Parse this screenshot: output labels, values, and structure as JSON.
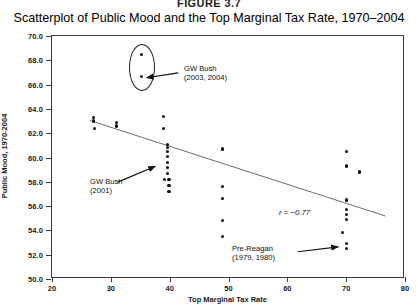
{
  "figure": {
    "number_label": "FIGURE 3.7",
    "title": "Scatterplot of Public Mood and the Top Marginal Tax Rate, 1970–2004"
  },
  "axes": {
    "x_title": "Top Marginal Tax Rate",
    "y_title": "Public Mood, 1970-2004",
    "x_ticks": [
      "20",
      "30",
      "40",
      "50",
      "60",
      "70",
      "80"
    ],
    "y_ticks": [
      "70.0",
      "68.0",
      "66.0",
      "64.0",
      "62.0",
      "60.0",
      "58.0",
      "56.0",
      "54.0",
      "52.0",
      "50.0"
    ]
  },
  "annotations": {
    "gw_bush_2003": "GW Bush\n(2003, 2004)",
    "gw_bush_2001": "GW Bush\n(2001)",
    "pre_reagan": "Pre-Reagan\n(1979, 1980)",
    "correlation": "r = −0.77"
  },
  "chart_data": {
    "type": "scatter",
    "title": "Scatterplot of Public Mood and the Top Marginal Tax Rate, 1970–2004",
    "xlabel": "Top Marginal Tax Rate",
    "ylabel": "Public Mood, 1970-2004",
    "xlim": [
      20,
      80
    ],
    "ylim": [
      50.0,
      70.0
    ],
    "x_ticks": [
      20,
      30,
      40,
      50,
      60,
      70,
      80
    ],
    "y_ticks": [
      50.0,
      52.0,
      54.0,
      56.0,
      58.0,
      60.0,
      62.0,
      64.0,
      66.0,
      68.0,
      70.0
    ],
    "grid": false,
    "legend": false,
    "correlation_r": -0.77,
    "correlation_label": "r = −0.77",
    "marker": "filled-circle",
    "marker_color": "#0d0d0d",
    "fit_line": {
      "type": "linear-regression",
      "color": "#6b6b6b",
      "x_start": 26.5,
      "y_start": 63.0,
      "x_end": 77.0,
      "y_end": 55.1
    },
    "highlight_ellipse": {
      "label": "GW Bush (2003, 2004)",
      "center_x": 35.2,
      "center_y": 67.5,
      "width_units": 4.1,
      "height_units": 3.7
    },
    "points": [
      {
        "x": 27.0,
        "y": 63.3
      },
      {
        "x": 27.0,
        "y": 63.0
      },
      {
        "x": 27.2,
        "y": 62.4
      },
      {
        "x": 31.0,
        "y": 62.9
      },
      {
        "x": 31.0,
        "y": 62.6
      },
      {
        "x": 35.2,
        "y": 68.5,
        "label": "GW Bush 2003"
      },
      {
        "x": 35.2,
        "y": 66.7,
        "label": "GW Bush 2004"
      },
      {
        "x": 38.9,
        "y": 63.4
      },
      {
        "x": 38.9,
        "y": 62.4
      },
      {
        "x": 39.6,
        "y": 61.1
      },
      {
        "x": 39.6,
        "y": 60.8
      },
      {
        "x": 39.6,
        "y": 60.5
      },
      {
        "x": 39.6,
        "y": 60.1
      },
      {
        "x": 39.6,
        "y": 59.6
      },
      {
        "x": 39.6,
        "y": 59.2
      },
      {
        "x": 39.6,
        "y": 58.7
      },
      {
        "x": 39.1,
        "y": 58.2,
        "label": "GW Bush 2001"
      },
      {
        "x": 39.9,
        "y": 58.2
      },
      {
        "x": 39.9,
        "y": 57.7
      },
      {
        "x": 39.9,
        "y": 57.2
      },
      {
        "x": 49.0,
        "y": 60.7
      },
      {
        "x": 49.0,
        "y": 57.6
      },
      {
        "x": 49.0,
        "y": 56.6
      },
      {
        "x": 49.0,
        "y": 54.8
      },
      {
        "x": 49.0,
        "y": 53.5
      },
      {
        "x": 70.0,
        "y": 60.5
      },
      {
        "x": 70.0,
        "y": 59.3
      },
      {
        "x": 72.2,
        "y": 58.8
      },
      {
        "x": 70.0,
        "y": 56.5
      },
      {
        "x": 70.0,
        "y": 55.7
      },
      {
        "x": 70.0,
        "y": 55.3
      },
      {
        "x": 70.0,
        "y": 54.9
      },
      {
        "x": 69.4,
        "y": 53.8
      },
      {
        "x": 70.0,
        "y": 52.9,
        "label": "Pre-Reagan 1979"
      },
      {
        "x": 70.0,
        "y": 52.5,
        "label": "Pre-Reagan 1980"
      }
    ]
  }
}
